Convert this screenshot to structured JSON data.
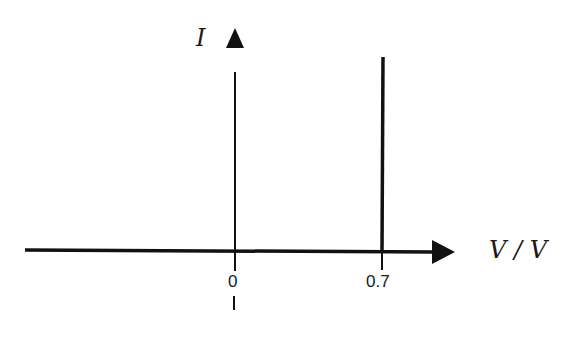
{
  "diagram": {
    "type": "I-V characteristic (ideal diode)",
    "y_axis": {
      "label": "I"
    },
    "x_axis": {
      "label": "V / V"
    },
    "ticks": [
      {
        "label": "0",
        "value": 0
      },
      {
        "label": "0.7",
        "value": 0.7
      }
    ],
    "curve": {
      "description": "Current is zero for V below 0.7 V, then rises vertically at V = 0.7 V",
      "knee_voltage": 0.7
    },
    "colors": {
      "line": "#111111",
      "background": "#ffffff"
    }
  }
}
